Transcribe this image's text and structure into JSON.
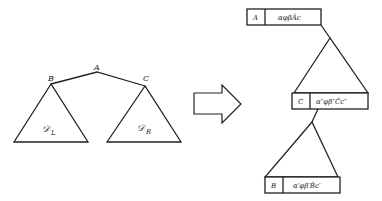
{
  "diagram": {
    "left_tree": {
      "root": "A",
      "left_child": "B",
      "right_child": "C",
      "left_subtree": "𝒟",
      "left_subtree_sub": "L",
      "right_subtree": "𝒟",
      "right_subtree_sub": "R"
    },
    "arrow": {
      "direction": "right"
    },
    "right_structure": {
      "nodes": [
        {
          "name": "A",
          "label": "αφβÂc",
          "primes": ""
        },
        {
          "name": "C",
          "label": "α″φβ″Ĉc″",
          "primes": "double"
        },
        {
          "name": "B",
          "label": "α′φβ′B̂c′",
          "primes": "single"
        }
      ]
    }
  }
}
